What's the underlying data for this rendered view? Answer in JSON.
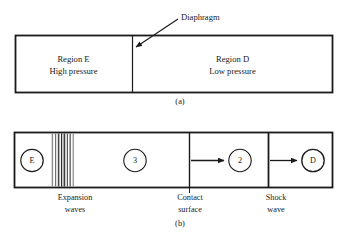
{
  "figure": {
    "background_color": "#ffffff",
    "line_color": "#1a1a1a",
    "wave_color": "#555555",
    "panels": [
      {
        "caption": "(a)",
        "annotation": {
          "label": "Diaphragm",
          "points_to": "divider"
        },
        "regions": [
          {
            "id": "E",
            "line1": "Region E",
            "line2": "High pressure"
          },
          {
            "id": "D",
            "line1": "Region D",
            "line2": "Low pressure"
          }
        ]
      },
      {
        "caption": "(b)",
        "nodes": [
          {
            "id": "E",
            "label": "E"
          },
          {
            "id": "3",
            "label": "3"
          },
          {
            "id": "2",
            "label": "2"
          },
          {
            "id": "D",
            "label": "D"
          }
        ],
        "feature_labels": [
          {
            "id": "expansion-waves",
            "line1": "Expansion",
            "line2": "waves"
          },
          {
            "id": "contact-surface",
            "line1": "Contact",
            "line2": "surface"
          },
          {
            "id": "shock-wave",
            "line1": "Shock",
            "line2": "wave"
          }
        ],
        "expansion_wave_count": 8
      }
    ]
  }
}
